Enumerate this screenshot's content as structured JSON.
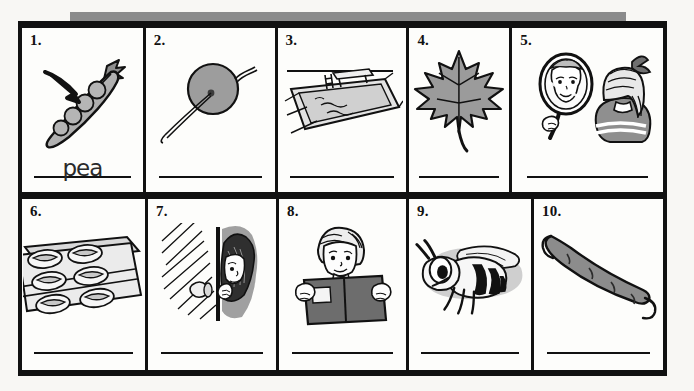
{
  "worksheet": {
    "title": "Picture word worksheet",
    "gray_bar_color": "#8b8b8b",
    "frame_color": "#111111",
    "page_background": "#f8f7f4",
    "rows": 2,
    "columns": 5
  },
  "cells": [
    {
      "number": "1.",
      "picture": "pea-pod-with-arrow",
      "answer": "pea",
      "line": true
    },
    {
      "number": "2.",
      "picture": "balloon-on-string",
      "answer": "",
      "line": true
    },
    {
      "number": "3.",
      "picture": "swimming-pool-with-diving-board",
      "answer": "",
      "line": true
    },
    {
      "number": "4.",
      "picture": "maple-leaf",
      "answer": "",
      "line": true
    },
    {
      "number": "5.",
      "picture": "girl-looking-in-hand-mirror",
      "answer": "",
      "line": true
    },
    {
      "number": "6.",
      "picture": "tray-of-bread-rolls",
      "answer": "",
      "line": true
    },
    {
      "number": "7.",
      "picture": "girl-peeking-through-door",
      "answer": "",
      "line": true
    },
    {
      "number": "8.",
      "picture": "child-reading-book",
      "answer": "",
      "line": true
    },
    {
      "number": "9.",
      "picture": "bee",
      "answer": "",
      "line": true
    },
    {
      "number": "10.",
      "picture": "pea-pod",
      "answer": "",
      "line": true
    }
  ]
}
